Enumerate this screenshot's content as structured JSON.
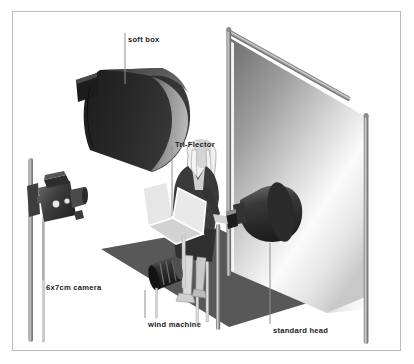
{
  "figure": {
    "type": "isometric-illustration",
    "frame_border_color": "#b9b9b9",
    "background_color": "#ffffff"
  },
  "labels": [
    {
      "id": "soft-box",
      "text": "soft box",
      "leader": "vertical-line-down"
    },
    {
      "id": "tri-flector",
      "text": "Tri-Flector",
      "leader": "vertical-line-down"
    },
    {
      "id": "camera",
      "text": "6x7cm camera",
      "leader": "vertical-line-up"
    },
    {
      "id": "wind-machine",
      "text": "wind machine",
      "leader": "vertical-line-up"
    },
    {
      "id": "standard-head",
      "text": "standard head",
      "leader": "vertical-line-up"
    }
  ],
  "objects": [
    {
      "id": "soft-box",
      "name": "soft box",
      "color_dark": "#2b2b2b",
      "color_light": "#8d8d8d"
    },
    {
      "id": "camera",
      "name": "6x7cm camera",
      "color_dark": "#3a3a3a",
      "color_light": "#9a9a9a"
    },
    {
      "id": "backdrop",
      "name": "background paper",
      "color_dark": "#7d7d7d",
      "color_light": "#ffffff"
    },
    {
      "id": "stand-left",
      "name": "backdrop stand left",
      "color": "#8a8a8a"
    },
    {
      "id": "stand-right",
      "name": "backdrop stand right",
      "color": "#8a8a8a"
    },
    {
      "id": "crossbar",
      "name": "backdrop crossbar",
      "color": "#8a8a8a"
    },
    {
      "id": "floor",
      "name": "studio floor mat",
      "color": "#585858"
    },
    {
      "id": "model",
      "name": "seated model",
      "color_suit": "#3c3c3c",
      "color_skin": "#d8d8d8"
    },
    {
      "id": "tri-flector",
      "name": "Tri-Flector reflector",
      "color": "#e4e4e4"
    },
    {
      "id": "standard-head",
      "name": "standard head light",
      "color": "#2f2f2f"
    },
    {
      "id": "wind-machine",
      "name": "wind machine",
      "color": "#303030"
    }
  ],
  "colors": {
    "ink": "#1b1b1b",
    "leader": "#8f8f8f",
    "frame": "#b9b9b9",
    "paper": "#ffffff"
  }
}
